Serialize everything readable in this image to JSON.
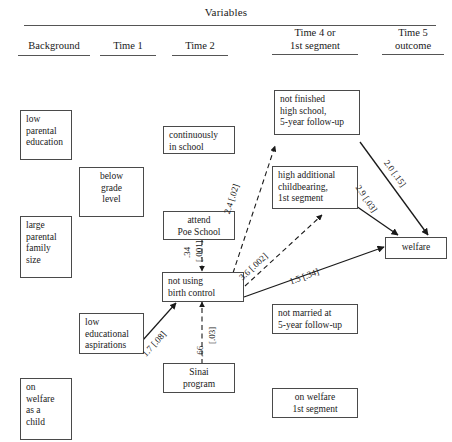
{
  "header": {
    "title": "Variables",
    "columns": [
      {
        "id": "background",
        "label": "Background"
      },
      {
        "id": "time1",
        "label": "Time 1"
      },
      {
        "id": "time2",
        "label": "Time 2"
      },
      {
        "id": "time4",
        "label": "Time 4 or\n1st segment",
        "line1": "Time 4 or",
        "line2": "1st segment"
      },
      {
        "id": "time5",
        "label": "Time 5\noutcome",
        "line1": "Time 5",
        "line2": "outcome"
      }
    ]
  },
  "nodes": [
    {
      "id": "low-parental-education",
      "text": "low\nparental\neducation"
    },
    {
      "id": "below-grade-level",
      "text": "below\ngrade\nlevel"
    },
    {
      "id": "large-parental-family-size",
      "text": "large\nparental\nfamily\nsize"
    },
    {
      "id": "low-educational-aspirations",
      "text": "low\neducational\naspirations"
    },
    {
      "id": "on-welfare-as-a-child",
      "text": "on\nwelfare\nas a\nchild"
    },
    {
      "id": "continuously-in-school",
      "text": "continuously\nin school"
    },
    {
      "id": "attend-poe-school",
      "text": "attend\nPoe School"
    },
    {
      "id": "not-using-birth-control",
      "text": "not using\nbirth control"
    },
    {
      "id": "sinai-program",
      "text": "Sinai\nprogram"
    },
    {
      "id": "not-finished-high-school",
      "text": "not finished\nhigh school,\n5-year follow-up"
    },
    {
      "id": "high-additional-childbearing",
      "text": "high additional\nchildbearing,\n1st segment"
    },
    {
      "id": "not-married-5-year",
      "text": "not married at\n5-year follow-up"
    },
    {
      "id": "on-welfare-1st-segment",
      "text": "on welfare\n1st segment"
    },
    {
      "id": "welfare",
      "text": "welfare"
    }
  ],
  "edges": [
    {
      "id": "poe-to-birthcontrol",
      "from": "attend-poe-school",
      "to": "not-using-birth-control",
      "style": "dashed",
      "coefficient": ".34",
      "pvalue": "[.001]",
      "label": ".34 [.001]"
    },
    {
      "id": "sinai-to-birthcontrol",
      "from": "sinai-program",
      "to": "not-using-birth-control",
      "style": "dashed",
      "coefficient": ".66",
      "pvalue": "[.03]",
      "label": ".66 [.03]"
    },
    {
      "id": "aspirations-to-birthcontrol",
      "from": "low-educational-aspirations",
      "to": "not-using-birth-control",
      "style": "solid",
      "coefficient": "1.7",
      "pvalue": "[.08]",
      "label": "1.7 [.08]"
    },
    {
      "id": "birthcontrol-to-nothighschool",
      "from": "not-using-birth-control",
      "to": "not-finished-high-school",
      "style": "dashed",
      "coefficient": "2.4",
      "pvalue": "[.02]",
      "label": "2.4 [.02]"
    },
    {
      "id": "birthcontrol-to-childbearing",
      "from": "not-using-birth-control",
      "to": "high-additional-childbearing",
      "style": "dashed",
      "coefficient": "3.6",
      "pvalue": "[.002]",
      "label": "3.6 [.002]"
    },
    {
      "id": "birthcontrol-to-welfare",
      "from": "not-using-birth-control",
      "to": "welfare",
      "style": "solid",
      "coefficient": "1.5",
      "pvalue": "[.34]",
      "label": "1.5 [.34]"
    },
    {
      "id": "nothighschool-to-welfare",
      "from": "not-finished-high-school",
      "to": "welfare",
      "style": "solid",
      "coefficient": "2.0",
      "pvalue": "[.15]",
      "label": "2.0 [.15]"
    },
    {
      "id": "childbearing-to-welfare",
      "from": "high-additional-childbearing",
      "to": "welfare",
      "style": "solid",
      "coefficient": "2.9",
      "pvalue": "[.03]",
      "label": "2.9 [.03]"
    }
  ],
  "edge_labels": {
    "poe_to_birthcontrol_num": ".34",
    "poe_to_birthcontrol_p": "[.001]",
    "sinai_to_birthcontrol_num": ".66",
    "sinai_to_birthcontrol_p": "[.03]",
    "aspirations_to_birthcontrol": "1.7 [.08]",
    "birthcontrol_to_nothighschool": "2.4 [.02]",
    "birthcontrol_to_childbearing": "3.6 [.002]",
    "birthcontrol_to_welfare": "1.5 [.34]",
    "nothighschool_to_welfare": "2.0 [.15]",
    "childbearing_to_welfare": "2.9 [.03]"
  },
  "node_text": {
    "low_parental_education": [
      "low",
      "parental",
      "education"
    ],
    "below_grade_level": [
      "below",
      "grade",
      "level"
    ],
    "large_parental_family_size": [
      "large",
      "parental",
      "family",
      "size"
    ],
    "low_educational_aspirations": [
      "low",
      "educational",
      "aspirations"
    ],
    "on_welfare_as_a_child": [
      "on",
      "welfare",
      "as a",
      "child"
    ],
    "continuously_in_school": [
      "continuously",
      "in school"
    ],
    "attend_poe_school": [
      "attend",
      "Poe School"
    ],
    "not_using_birth_control": [
      "not using",
      "birth control"
    ],
    "sinai_program": [
      "Sinai",
      "program"
    ],
    "not_finished_high_school": [
      "not finished",
      "high school,",
      "5-year follow-up"
    ],
    "high_additional_childbearing": [
      "high additional",
      "childbearing,",
      "1st segment"
    ],
    "not_married_5_year": [
      "not married at",
      "5-year follow-up"
    ],
    "on_welfare_1st_segment": [
      "on welfare",
      "1st segment"
    ],
    "welfare": [
      "welfare"
    ]
  },
  "colors": {
    "ink": "#1a1a1a",
    "box_border": "#4a4a4a",
    "rule": "#555555",
    "background": "#ffffff"
  }
}
